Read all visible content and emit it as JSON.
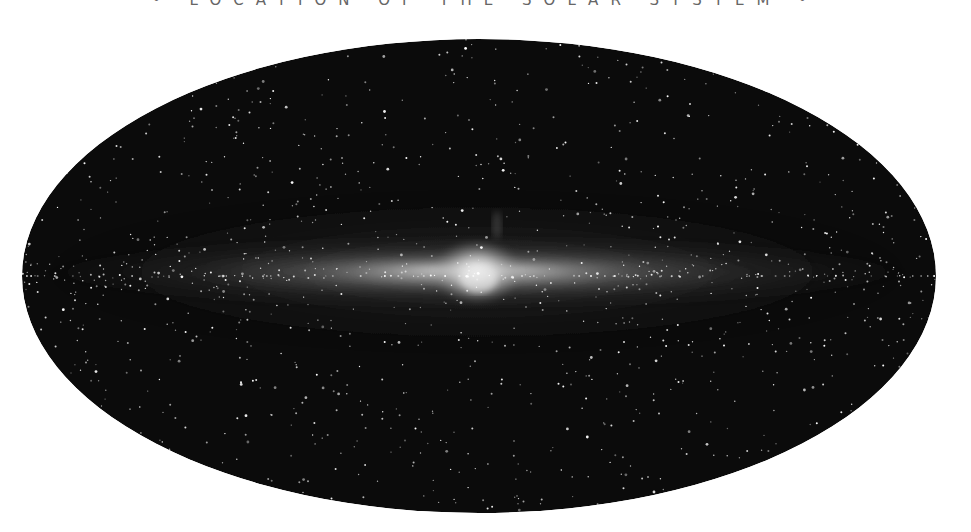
{
  "caption": {
    "text": "• LOCATION OF THE SOLAR SYSTEM •"
  },
  "sky_map": {
    "projection": "all-sky elliptical (Mollweide-style) view of the Milky Way",
    "subject": "Milky Way galactic plane with central bulge",
    "ellipse": {
      "cx": 479,
      "cy": 276,
      "rx": 457,
      "ry": 237
    },
    "colors": {
      "background": "#ffffff",
      "sky": "#0b0b0b",
      "band": "#d8d8d8",
      "bulge": "#f0f0f0",
      "stars": "#ffffff",
      "caption": "#666666"
    },
    "galactic_center": {
      "x": 477,
      "y": 272
    },
    "star_count": 1500
  }
}
